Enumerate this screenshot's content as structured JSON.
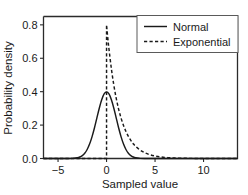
{
  "chart_data": {
    "type": "line",
    "title": "",
    "xlabel": "Sampled value",
    "ylabel": "Probability density",
    "xlim": [
      -6.5,
      13.5
    ],
    "ylim": [
      0.0,
      0.85
    ],
    "grid": false,
    "legend_position": "upper right",
    "xticks": [
      -5,
      0,
      5,
      10
    ],
    "xticklabels": [
      "−5",
      "0",
      "5",
      "10"
    ],
    "yticks": [
      0.0,
      0.2,
      0.4,
      0.6,
      0.8
    ],
    "yticklabels": [
      "0.0",
      "0.2",
      "0.4",
      "0.6",
      "0.8"
    ],
    "series": [
      {
        "name": "Normal",
        "style": "solid",
        "color": "#1a1a1a",
        "description": "Gaussian probability density, mean 0, standard deviation 1, peak 0.399 at x = 0",
        "x": [
          -6.5,
          -6.0,
          -5.5,
          -5.0,
          -4.5,
          -4.0,
          -3.5,
          -3.0,
          -2.75,
          -2.5,
          -2.25,
          -2.0,
          -1.75,
          -1.5,
          -1.25,
          -1.0,
          -0.75,
          -0.5,
          -0.25,
          0.0,
          0.25,
          0.5,
          0.75,
          1.0,
          1.25,
          1.5,
          1.75,
          2.0,
          2.25,
          2.5,
          2.75,
          3.0,
          3.5,
          4.0,
          4.5,
          5.0,
          5.5,
          6.0,
          7.0,
          8.0,
          9.0,
          10.0,
          11.0,
          12.0,
          13.5
        ],
        "y": [
          0.0,
          0.0,
          0.0,
          0.0,
          0.0,
          0.0001,
          0.0009,
          0.0044,
          0.0091,
          0.0175,
          0.0317,
          0.054,
          0.0863,
          0.1295,
          0.1826,
          0.242,
          0.3011,
          0.3521,
          0.3867,
          0.3989,
          0.3867,
          0.3521,
          0.3011,
          0.242,
          0.1826,
          0.1295,
          0.0863,
          0.054,
          0.0317,
          0.0175,
          0.0091,
          0.0044,
          0.0009,
          0.0001,
          0.0,
          0.0,
          0.0,
          0.0,
          0.0,
          0.0,
          0.0,
          0.0,
          0.0,
          0.0,
          0.0
        ]
      },
      {
        "name": "Exponential",
        "style": "dashed",
        "color": "#1a1a1a",
        "description": "Exponential probability density, rate 0.8, peak 0.8 at x = 0, zero for x < 0",
        "x": [
          -6.5,
          -0.02,
          0.0,
          0.05,
          0.15,
          0.25,
          0.5,
          0.75,
          1.0,
          1.25,
          1.5,
          1.75,
          2.0,
          2.25,
          2.5,
          2.75,
          3.0,
          3.5,
          4.0,
          4.5,
          5.0,
          5.5,
          6.0,
          6.5,
          7.0,
          8.0,
          9.0,
          10.0,
          11.0,
          12.0,
          13.5
        ],
        "y": [
          0.0,
          0.0,
          0.8,
          0.7686,
          0.7085,
          0.655,
          0.5363,
          0.4391,
          0.3595,
          0.2944,
          0.241,
          0.1973,
          0.1615,
          0.1323,
          0.1083,
          0.0887,
          0.0726,
          0.0487,
          0.0326,
          0.0219,
          0.0147,
          0.0098,
          0.0066,
          0.0044,
          0.003,
          0.0013,
          0.0006,
          0.0003,
          0.0001,
          0.0,
          0.0
        ]
      }
    ]
  },
  "legend": {
    "entries": [
      {
        "label": "Normal",
        "style": "solid"
      },
      {
        "label": "Exponential",
        "style": "dashed"
      }
    ]
  },
  "axes": {
    "x_title": "Sampled value",
    "y_title": "Probability density"
  },
  "colors": {
    "line": "#1a1a1a",
    "axis": "#2b2b2b",
    "background": "#ffffff"
  }
}
